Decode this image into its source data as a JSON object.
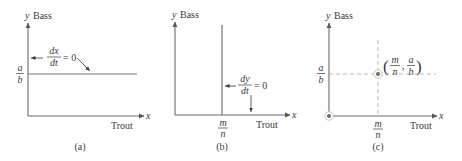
{
  "figure": {
    "panels": [
      {
        "id": "a",
        "caption": "(a)",
        "y_axis_var": "y",
        "y_axis_label": "Bass",
        "x_axis_var": "x",
        "x_axis_label": "Trout",
        "y_tick": {
          "num": "a",
          "den": "b"
        },
        "isocline": {
          "num": "dx",
          "den": "dt",
          "rhs": "= 0",
          "orientation": "horizontal"
        }
      },
      {
        "id": "b",
        "caption": "(b)",
        "y_axis_var": "y",
        "y_axis_label": "Bass",
        "x_axis_var": "x",
        "x_axis_label": "Trout",
        "x_tick": {
          "num": "m",
          "den": "n"
        },
        "isocline": {
          "num": "dy",
          "den": "dt",
          "rhs": "= 0",
          "orientation": "vertical"
        }
      },
      {
        "id": "c",
        "caption": "(c)",
        "y_axis_var": "y",
        "y_axis_label": "Bass",
        "x_axis_var": "x",
        "x_axis_label": "Trout",
        "y_tick": {
          "num": "a",
          "den": "b"
        },
        "x_tick": {
          "num": "m",
          "den": "n"
        },
        "equilibrium_label": {
          "open": "(",
          "x_num": "m",
          "x_den": "n",
          "sep": ",",
          "y_num": "a",
          "y_den": "b",
          "close": ")"
        },
        "equilibria": [
          "origin",
          "interior"
        ]
      }
    ],
    "colors": {
      "axis": "#6e6a64",
      "curve": "#7a7670",
      "dashed": "#b9b6b1",
      "text": "#3a3a3a",
      "point_fill": "#6b6b6b",
      "point_ring": "#c9c6c2"
    }
  }
}
